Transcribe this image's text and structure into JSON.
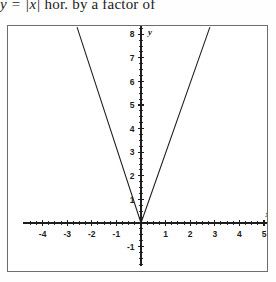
{
  "caption": {
    "math_prefix": "y = |x|",
    "text_suffix": " hor. by a factor of"
  },
  "figure": {
    "border_color": "#6d6d6d",
    "background": "#ffffff"
  },
  "chart_data": {
    "type": "line",
    "title": "",
    "subtitle": "",
    "xlabel": "x",
    "ylabel": "y",
    "xlim": [
      -4.7,
      5.2
    ],
    "ylim": [
      -1.9,
      8.3
    ],
    "grid": false,
    "legend": null,
    "axis_color": "#1d1d1d",
    "curve_color": "#1d1d1d",
    "x_ticks_major": [
      -4,
      -3,
      -2,
      -1,
      1,
      2,
      3,
      4,
      5
    ],
    "x_tick_labels": [
      "-4",
      "-3",
      "-2",
      "-1",
      "1",
      "2",
      "3",
      "4",
      "5"
    ],
    "x_ticks_minor_step": 0.25,
    "y_ticks_major": [
      -1,
      1,
      2,
      3,
      4,
      5,
      6,
      7,
      8
    ],
    "y_tick_labels": [
      "-1",
      "1",
      "2",
      "3",
      "4",
      "5",
      "6",
      "7",
      "8"
    ],
    "y_ticks_minor_step": 0.25,
    "series": [
      {
        "name": "y = |x| stretched horizontally",
        "equation_note": "V-shape vertex at origin",
        "points": [
          {
            "x": -2.6,
            "y": 8.3
          },
          {
            "x": 0,
            "y": 0
          },
          {
            "x": 2.8,
            "y": 8.3
          }
        ],
        "left_slope": -3.2,
        "right_slope": 2.95,
        "vertex": {
          "x": 0,
          "y": 0
        }
      }
    ]
  }
}
